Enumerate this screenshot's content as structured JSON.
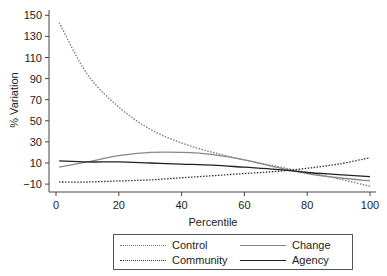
{
  "chart_data": {
    "type": "line",
    "title": "",
    "xlabel": "Percentile",
    "ylabel": "% Variation",
    "xlim": [
      0,
      100
    ],
    "ylim": [
      -15,
      155
    ],
    "xticks": [
      0,
      20,
      40,
      60,
      80,
      100
    ],
    "yticks": [
      -10,
      10,
      30,
      50,
      70,
      90,
      110,
      130,
      150
    ],
    "grid": false,
    "legend_position": "bottom",
    "x": [
      1,
      10,
      20,
      30,
      40,
      50,
      60,
      70,
      80,
      90,
      100
    ],
    "series": [
      {
        "name": "Control",
        "style": "dotted",
        "color": "#777777",
        "values": [
          143,
          94,
          63,
          42,
          29,
          20,
          13,
          7,
          1,
          -5,
          -12
        ]
      },
      {
        "name": "Change",
        "style": "solid",
        "color": "#888888",
        "values": [
          6,
          11,
          17,
          20,
          20,
          18,
          13,
          6,
          0,
          -4,
          -7
        ]
      },
      {
        "name": "Community",
        "style": "dotted",
        "color": "#333333",
        "values": [
          -8,
          -8,
          -7,
          -6,
          -4,
          -2,
          0,
          2,
          5,
          9,
          15
        ]
      },
      {
        "name": "Agency",
        "style": "solid",
        "color": "#222222",
        "values": [
          12,
          11,
          11,
          10,
          9,
          8,
          6,
          4,
          1,
          -1,
          -3
        ]
      }
    ]
  },
  "legend": {
    "items": [
      {
        "label": "Control"
      },
      {
        "label": "Change"
      },
      {
        "label": "Community"
      },
      {
        "label": "Agency"
      }
    ]
  }
}
